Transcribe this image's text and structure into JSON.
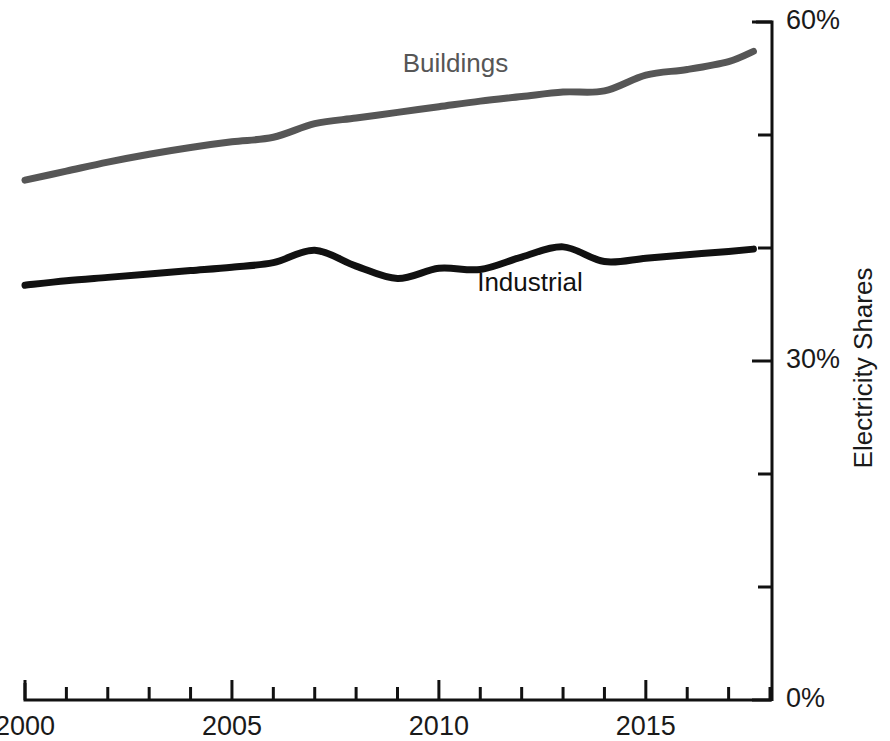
{
  "chart_data": {
    "type": "line",
    "title": "",
    "subtitle": "",
    "xlabel": "",
    "ylabel": "Electricity Shares",
    "xlim": [
      2000,
      2018
    ],
    "ylim": [
      0,
      60
    ],
    "grid": false,
    "legend_position": "inline-labels",
    "y_axis_side": "right",
    "y_tick_labels": [
      "60%",
      "30%",
      "0%"
    ],
    "y_tick_values": [
      60,
      50,
      40,
      30,
      20,
      10,
      0
    ],
    "y_labeled_values": [
      60,
      30,
      0
    ],
    "x_tick_labels": [
      "2000",
      "2005",
      "2010",
      "2015"
    ],
    "x_labeled_values": [
      2000,
      2005,
      2010,
      2015
    ],
    "x_tick_values": [
      2000,
      2001,
      2002,
      2003,
      2004,
      2005,
      2006,
      2007,
      2008,
      2009,
      2010,
      2011,
      2012,
      2013,
      2014,
      2015,
      2016,
      2017,
      2018
    ],
    "x": [
      2000,
      2001,
      2002,
      2003,
      2004,
      2005,
      2006,
      2007,
      2008,
      2009,
      2010,
      2011,
      2012,
      2013,
      2014,
      2015,
      2016,
      2017,
      2017.6
    ],
    "series": [
      {
        "name": "Buildings",
        "color": "#565656",
        "label_x": 2010.4,
        "label_y": 55.6,
        "values": [
          46.0,
          46.8,
          47.6,
          48.3,
          48.9,
          49.4,
          49.8,
          51.0,
          51.5,
          52.0,
          52.5,
          53.0,
          53.4,
          53.8,
          53.9,
          55.3,
          55.8,
          56.5,
          57.4
        ]
      },
      {
        "name": "Industrial",
        "color": "#111111",
        "label_x": 2012.2,
        "label_y": 36.2,
        "values": [
          36.7,
          37.1,
          37.4,
          37.7,
          38.0,
          38.3,
          38.7,
          39.8,
          38.4,
          37.3,
          38.2,
          38.1,
          39.2,
          40.1,
          38.8,
          39.1,
          39.4,
          39.7,
          39.9
        ]
      }
    ]
  },
  "axis": {
    "y_title": "Electricity Shares",
    "y_labels": [
      {
        "value": "60%",
        "at": 60
      },
      {
        "value": "30%",
        "at": 30
      },
      {
        "value": "0%",
        "at": 0
      }
    ],
    "x_labels": [
      {
        "value": "2000",
        "at": 2000
      },
      {
        "value": "2005",
        "at": 2005
      },
      {
        "value": "2010",
        "at": 2010
      },
      {
        "value": "2015",
        "at": 2015
      }
    ]
  },
  "colors": {
    "background": "#ffffff",
    "axis": "#111111",
    "buildings": "#565656",
    "industrial": "#111111"
  }
}
